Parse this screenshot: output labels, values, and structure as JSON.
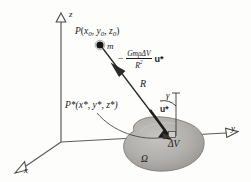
{
  "figure": {
    "background_color": "#fdfdfc",
    "ink_color": "#19191b",
    "body_fill_color": "#b0aeac",
    "body_edge_color": "#8a8885"
  },
  "axes": {
    "z_label": "z",
    "y_label": "y",
    "x_label": "x",
    "origin_label": ""
  },
  "labels": {
    "point_P_name": "P",
    "point_P_coords_open": "(",
    "point_P_x": "x",
    "point_P_x_sub": "0",
    "point_P_sep1": ", ",
    "point_P_y": "y",
    "point_P_y_sub": "0",
    "point_P_sep2": ", ",
    "point_P_z": "z",
    "point_P_z_sub": "0",
    "point_P_coords_close": ")",
    "mass_label": "m",
    "distance_label": "R",
    "angle_label": "γ",
    "unit_vector_label": "u*",
    "point_Pstar_label": "P*(x*, y*, z*)",
    "volume_element_label": "ΔV",
    "region_label": "Ω"
  },
  "force_expression": {
    "sign": "−",
    "numerator": "GmρΔV",
    "denominator_base": "R",
    "denominator_exp": "2",
    "unit_vector": "u*",
    "full_text": "− (GmρΔV / R²) u*"
  }
}
